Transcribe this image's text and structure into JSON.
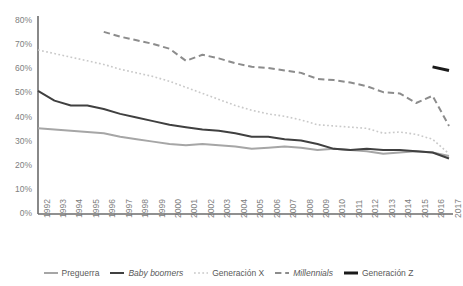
{
  "chart_data": {
    "type": "line",
    "title": "",
    "subtitle": "",
    "xlabel": "",
    "ylabel": "",
    "ylim": [
      0,
      80
    ],
    "ytick_labels": [
      "0%",
      "10%",
      "20%",
      "30%",
      "40%",
      "50%",
      "60%",
      "70%",
      "80%"
    ],
    "ytick_values": [
      0,
      10,
      20,
      30,
      40,
      50,
      60,
      70,
      80
    ],
    "grid": false,
    "legend_position": "bottom",
    "categories": [
      "1992",
      "1993",
      "1994",
      "1995",
      "1996",
      "1997",
      "1998",
      "1999",
      "2000",
      "2001",
      "2002",
      "2003",
      "2004",
      "2005",
      "2006",
      "2007",
      "2008",
      "2009",
      "2010",
      "2011",
      "2012",
      "2013",
      "2014",
      "2015",
      "2016",
      "2017"
    ],
    "series": [
      {
        "name": "Preguerra",
        "style": "solid",
        "color": "#a6a6a6",
        "width": 2,
        "values": [
          35.5,
          35.0,
          34.5,
          34.0,
          33.5,
          32.0,
          31.0,
          30.0,
          29.0,
          28.5,
          29.0,
          28.5,
          28.0,
          27.0,
          27.5,
          28.0,
          27.5,
          26.5,
          27.0,
          26.5,
          26.0,
          25.0,
          25.5,
          26.0,
          25.5,
          24.0
        ]
      },
      {
        "name": "Baby boomers",
        "style": "solid",
        "color": "#404040",
        "width": 2,
        "italic_label": true,
        "values": [
          51.0,
          47.0,
          45.0,
          45.0,
          43.5,
          41.5,
          40.0,
          38.5,
          37.0,
          36.0,
          35.0,
          34.5,
          33.5,
          32.0,
          32.0,
          31.0,
          30.5,
          29.0,
          27.0,
          26.5,
          27.0,
          26.5,
          26.5,
          26.0,
          25.5,
          23.0
        ]
      },
      {
        "name": "Generación X",
        "style": "dotted",
        "color": "#c9c9c9",
        "width": 1.6,
        "values": [
          68.0,
          66.5,
          65.0,
          63.5,
          62.0,
          60.0,
          58.5,
          57.0,
          55.0,
          52.5,
          50.0,
          47.5,
          45.0,
          43.0,
          41.5,
          40.5,
          39.0,
          37.0,
          36.5,
          36.0,
          35.5,
          33.5,
          34.0,
          33.0,
          31.0,
          25.0
        ]
      },
      {
        "name": "Millennials",
        "style": "dashed",
        "color": "#8c8c8c",
        "width": 2,
        "italic_label": true,
        "values": [
          null,
          null,
          null,
          null,
          75.5,
          73.5,
          72.0,
          70.5,
          68.5,
          63.5,
          66.0,
          64.5,
          62.5,
          61.0,
          60.5,
          59.5,
          58.5,
          56.0,
          55.5,
          54.5,
          53.0,
          50.5,
          50.0,
          46.0,
          49.0,
          36.5
        ]
      },
      {
        "name": "Generación Z",
        "style": "solid",
        "color": "#1a1a1a",
        "width": 3,
        "values": [
          null,
          null,
          null,
          null,
          null,
          null,
          null,
          null,
          null,
          null,
          null,
          null,
          null,
          null,
          null,
          null,
          null,
          null,
          null,
          null,
          null,
          null,
          null,
          null,
          61.0,
          59.5
        ]
      }
    ]
  },
  "legend": {
    "items": [
      {
        "label": "Preguerra",
        "color": "#a6a6a6",
        "style": "solid"
      },
      {
        "label": "Baby boomers",
        "color": "#404040",
        "style": "solid"
      },
      {
        "label": "Generación X",
        "color": "#c9c9c9",
        "style": "dotted"
      },
      {
        "label": "Millennials",
        "color": "#8c8c8c",
        "style": "dashed"
      },
      {
        "label": "Generación Z",
        "color": "#1a1a1a",
        "style": "solid"
      }
    ]
  }
}
